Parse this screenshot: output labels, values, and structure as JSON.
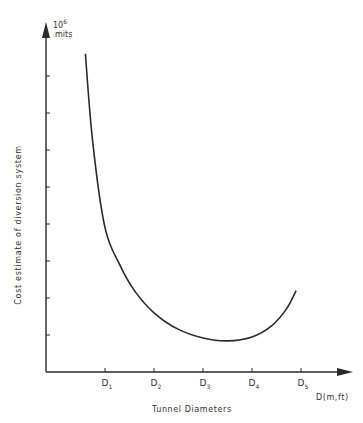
{
  "chart_data": {
    "type": "line",
    "title": "",
    "xlabel": "Tunnel Diameters",
    "x_unit": "D(m,ft)",
    "ylabel": "Cost estimate of diversion system",
    "y_unit_exp": "10",
    "y_unit_sup": "6",
    "y_unit_word": "mits",
    "x_ticks": [
      {
        "base": "D",
        "sub": "1",
        "value": 1
      },
      {
        "base": "D",
        "sub": "2",
        "value": 2
      },
      {
        "base": "D",
        "sub": "3",
        "value": 3
      },
      {
        "base": "D",
        "sub": "4",
        "value": 4
      },
      {
        "base": "D",
        "sub": "5",
        "value": 5
      }
    ],
    "y_ticks_count": 8,
    "y_tick_labels": [],
    "xlim": [
      0,
      6.1
    ],
    "ylim": [
      0,
      9.2
    ],
    "grid": false,
    "legend": null,
    "series": [
      {
        "name": "Cost estimate",
        "x": [
          0.6,
          0.75,
          1.0,
          1.3,
          1.6,
          2.0,
          2.5,
          3.0,
          3.5,
          4.0,
          4.4,
          4.7,
          4.9
        ],
        "y": [
          8.6,
          6.2,
          3.9,
          2.9,
          2.2,
          1.6,
          1.15,
          0.92,
          0.84,
          0.95,
          1.25,
          1.7,
          2.2
        ]
      }
    ]
  }
}
